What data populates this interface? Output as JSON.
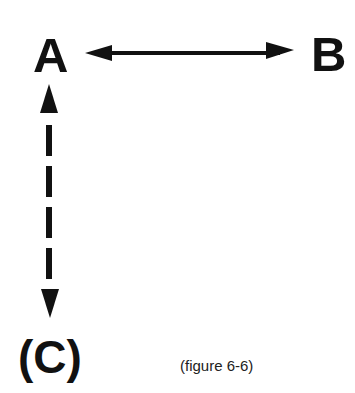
{
  "diagram": {
    "nodes": [
      {
        "id": "A",
        "label": "A"
      },
      {
        "id": "B",
        "label": "B"
      },
      {
        "id": "C",
        "label": "(C)"
      }
    ],
    "edges": [
      {
        "from": "A",
        "to": "B",
        "style": "solid",
        "direction": "bidirectional"
      },
      {
        "from": "A",
        "to": "C",
        "style": "dashed",
        "direction": "bidirectional"
      }
    ],
    "caption": "(figure 6-6)",
    "colors": {
      "ink": "#111111",
      "background": "#ffffff"
    }
  }
}
